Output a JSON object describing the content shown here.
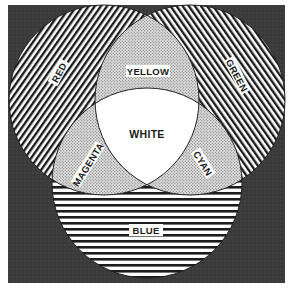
{
  "diagram": {
    "type": "venn-color-mixing",
    "background_color": "#3a3a3a",
    "circles": [
      {
        "name": "red",
        "label": "RED",
        "fill_pattern": "diagonal-lines-right"
      },
      {
        "name": "green",
        "label": "GREEN",
        "fill_pattern": "diagonal-lines-left"
      },
      {
        "name": "blue",
        "label": "BLUE",
        "fill_pattern": "horizontal-lines"
      }
    ],
    "overlaps": [
      {
        "name": "yellow",
        "label": "YELLOW",
        "between": [
          "red",
          "green"
        ],
        "fill_pattern": "stipple"
      },
      {
        "name": "magenta",
        "label": "MAGENTA",
        "between": [
          "red",
          "blue"
        ],
        "fill_pattern": "stipple"
      },
      {
        "name": "cyan",
        "label": "CYAN",
        "between": [
          "green",
          "blue"
        ],
        "fill_pattern": "stipple"
      },
      {
        "name": "white",
        "label": "WHITE",
        "between": [
          "red",
          "green",
          "blue"
        ],
        "fill_pattern": "solid-white"
      }
    ]
  },
  "labels": {
    "red": "RED",
    "green": "GREEN",
    "blue": "BLUE",
    "yellow": "YELLOW",
    "magenta": "MAGENTA",
    "cyan": "CYAN",
    "white": "WHITE"
  }
}
